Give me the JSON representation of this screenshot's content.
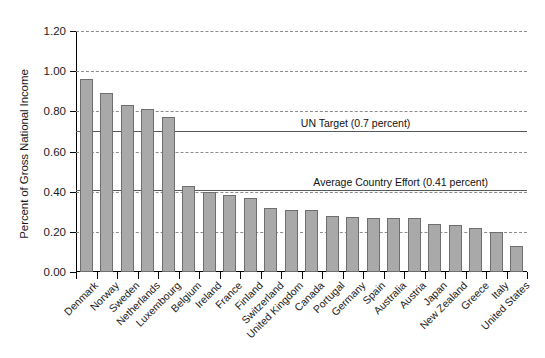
{
  "chart_data": {
    "type": "bar",
    "title": "",
    "xlabel": "",
    "ylabel": "Percent of Gross National Income",
    "ylim": [
      0.0,
      1.2
    ],
    "ytick_labels": [
      "0.00",
      "0.20",
      "0.40",
      "0.60",
      "0.80",
      "1.00",
      "1.20"
    ],
    "ytick_values": [
      0.0,
      0.2,
      0.4,
      0.6,
      0.8,
      1.0,
      1.2
    ],
    "grid": "horizontal-dashed",
    "legend": "none",
    "categories": [
      "Denmark",
      "Norway",
      "Sweden",
      "Netherlands",
      "Luxembourg",
      "Belgium",
      "Ireland",
      "France",
      "Finland",
      "Switzerland",
      "United Kingdom",
      "Canada",
      "Portugal",
      "Germany",
      "Spain",
      "Australia",
      "Austria",
      "Japan",
      "New Zealand",
      "Greece",
      "Italy",
      "United States"
    ],
    "values": [
      0.96,
      0.89,
      0.83,
      0.81,
      0.77,
      0.43,
      0.4,
      0.385,
      0.37,
      0.32,
      0.31,
      0.31,
      0.28,
      0.275,
      0.27,
      0.27,
      0.27,
      0.24,
      0.235,
      0.22,
      0.2,
      0.13
    ],
    "annotations": [
      {
        "label": "UN Target (0.7 percent)",
        "value": 0.7,
        "label_x_frac": 0.62
      },
      {
        "label": "Average Country Effort (0.41 percent)",
        "value": 0.41,
        "label_x_frac": 0.72
      }
    ],
    "bar_color": "#a9a9a9",
    "bar_border_color": "#6f6f6f",
    "grid_color": "#8c8c8c",
    "axis_color": "#000000",
    "reference_line_color": "#55595c"
  }
}
